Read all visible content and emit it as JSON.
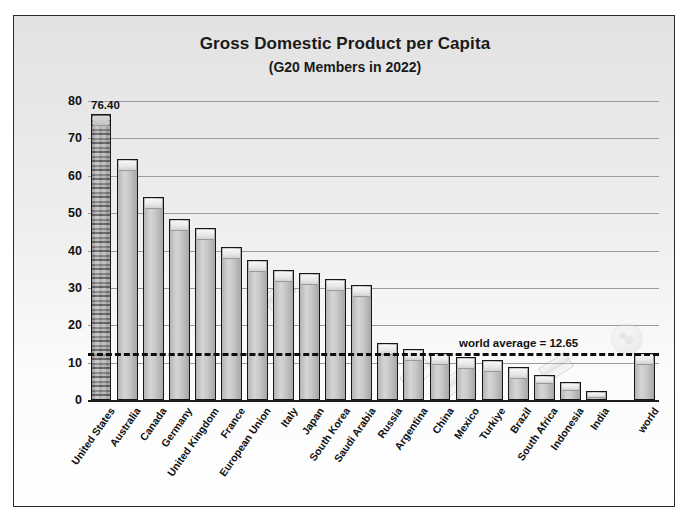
{
  "chart_data": {
    "type": "bar",
    "title": "Gross Domestic Product per Capita",
    "subtitle": "(G20 Members in 2022)",
    "xlabel": "",
    "ylabel": "Thousands of 2022 U.S. Dollars per Capita",
    "ylim": [
      0,
      80
    ],
    "yticks": [
      "80",
      "70",
      "60",
      "50",
      "40",
      "30",
      "20",
      "10",
      "0"
    ],
    "ytick_values": [
      80,
      70,
      60,
      50,
      40,
      30,
      20,
      10,
      0
    ],
    "grid": true,
    "legend_position": "none",
    "categories": [
      "United States",
      "Australia",
      "Canada",
      "Germany",
      "United Kingdom",
      "France",
      "European Union",
      "Italy",
      "Japan",
      "South Korea",
      "Saudi Arabia",
      "Russia",
      "Argentina",
      "China",
      "Mexico",
      "Turkiye",
      "Brazil",
      "South Africa",
      "Indonesia",
      "India",
      "world"
    ],
    "values": [
      76.4,
      64.4,
      54.3,
      48.4,
      45.9,
      41.0,
      37.4,
      34.8,
      34.0,
      32.4,
      30.9,
      15.3,
      13.7,
      12.7,
      11.5,
      10.6,
      8.9,
      6.8,
      4.8,
      2.4,
      12.65
    ],
    "data_labels": [
      {
        "category": "United States",
        "text": "76.40"
      }
    ],
    "reference_line": {
      "label": "world average = 12.65",
      "value": 12.65,
      "style": "dashed"
    },
    "notes": {
      "highlighted_bar": "United States",
      "separated_bar": "world"
    }
  },
  "colors": {
    "bar_fill": "#c9c9c9",
    "bar_edge": "#171717",
    "gridline": "#9b9b9b",
    "reference_line": "#0d0d0d",
    "text": "#111111",
    "frame": "#2b2b2b",
    "background": "#eeeeee"
  }
}
